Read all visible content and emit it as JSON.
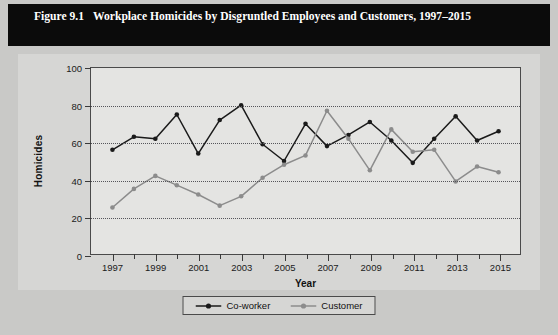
{
  "figure": {
    "number": "Figure 9.1",
    "title": "Workplace Homicides by Disgruntled Employees and Customers, 1997–2015"
  },
  "colors": {
    "banner_background": "#0b0b0b",
    "banner_text": "#ffffff",
    "page_background": "#c9c9c7",
    "card_background": "#d6d6d4",
    "plot_background": "#e4e4e2",
    "axis": "#4a4a4a",
    "gridline": "#55555a",
    "coworker": "#1a1a1a",
    "customer": "#8c8c8c"
  },
  "chart_data": {
    "type": "line",
    "title": "Workplace Homicides by Disgruntled Employees and Customers, 1997–2015",
    "xlabel": "Year",
    "ylabel": "Homicides",
    "xlim": [
      1996,
      2016
    ],
    "ylim": [
      0,
      100
    ],
    "ytick_labels": [
      "0",
      "20",
      "40",
      "60",
      "80",
      "100"
    ],
    "yticks": [
      0,
      20,
      40,
      60,
      80,
      100
    ],
    "xtick_labels": [
      "1997",
      "1999",
      "2001",
      "2003",
      "2005",
      "2007",
      "2009",
      "2011",
      "2013",
      "2015"
    ],
    "xticks_major": [
      1997,
      1999,
      2001,
      2003,
      2005,
      2007,
      2009,
      2011,
      2013,
      2015
    ],
    "x": [
      1997,
      1998,
      1999,
      2000,
      2001,
      2002,
      2003,
      2004,
      2005,
      2006,
      2007,
      2008,
      2009,
      2010,
      2011,
      2012,
      2013,
      2014,
      2015
    ],
    "grid": true,
    "grid_axis": "y",
    "legend_position": "bottom",
    "series": [
      {
        "name": "Co-worker",
        "color": "#1a1a1a",
        "values": [
          56,
          63,
          62,
          75,
          54,
          72,
          80,
          59,
          50,
          70,
          58,
          64,
          71,
          61,
          49,
          62,
          74,
          61,
          66
        ]
      },
      {
        "name": "Customer",
        "color": "#8c8c8c",
        "values": [
          25,
          35,
          42,
          37,
          32,
          26,
          31,
          41,
          48,
          53,
          77,
          62,
          45,
          67,
          55,
          56,
          39,
          47,
          44
        ]
      }
    ]
  },
  "legend": {
    "items": [
      {
        "label": "Co-worker"
      },
      {
        "label": "Customer"
      }
    ]
  }
}
